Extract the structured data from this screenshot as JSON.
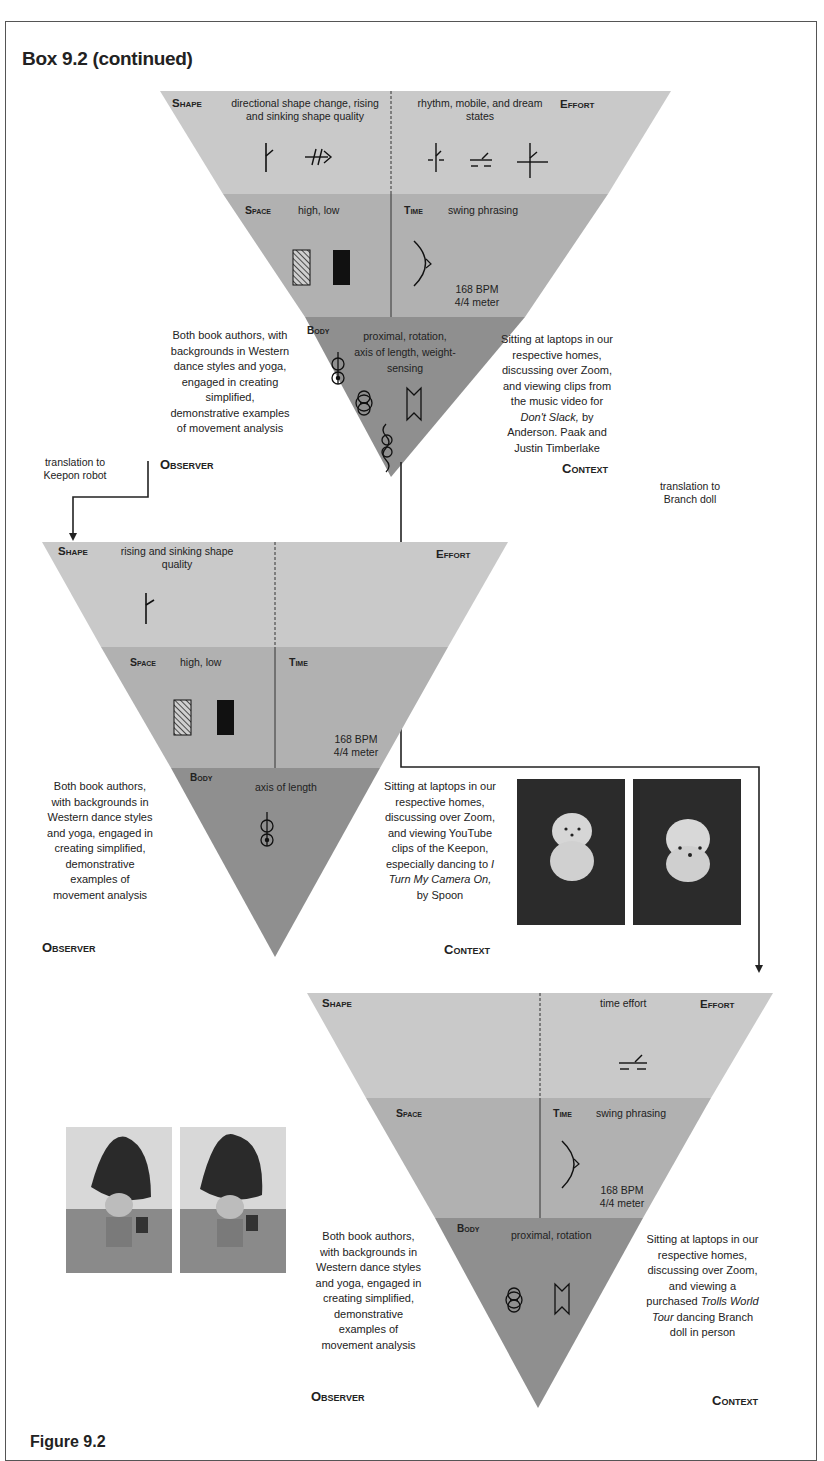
{
  "box": {
    "title": "Box 9.2 (continued)",
    "figure_label": "Figure 9.2"
  },
  "diagrams": [
    {
      "id": "original",
      "shape": {
        "label": "Shape",
        "text": "directional shape change, rising and sinking shape quality",
        "line1": "directional shape change, rising",
        "line2": "and sinking shape quality"
      },
      "effort": {
        "label": "Effort",
        "line1": "rhythm, mobile, and dream",
        "line2": "states"
      },
      "space": {
        "label": "Space",
        "text": "high, low"
      },
      "time": {
        "label": "Time",
        "text": "swing phrasing",
        "bpm": "168 BPM",
        "meter": "4/4 meter"
      },
      "body": {
        "label": "Body",
        "line1": "proximal, rotation,",
        "line2": "axis of length, weight-",
        "line3": "sensing"
      },
      "observer": {
        "label": "Observer",
        "lines": [
          "Both book authors, with",
          "backgrounds in Western",
          "dance styles and yoga,",
          "engaged in creating",
          "simplified,",
          "demonstrative examples",
          "of movement analysis"
        ]
      },
      "context": {
        "label": "Context",
        "lines": [
          "Sitting at laptops in our",
          "respective homes,",
          "discussing over Zoom,",
          "and viewing clips from",
          "the music video for"
        ],
        "italic": "Don't Slack,",
        "after_italic": " by",
        "tail": [
          "Anderson. Paak and",
          "Justin Timberlake"
        ]
      }
    },
    {
      "id": "keepon",
      "shape": {
        "label": "Shape",
        "line1": "rising and sinking shape",
        "line2": "quality"
      },
      "effort": {
        "label": "Effort"
      },
      "space": {
        "label": "Space",
        "text": "high, low"
      },
      "time": {
        "label": "Time",
        "bpm": "168 BPM",
        "meter": "4/4 meter"
      },
      "body": {
        "label": "Body",
        "line1": "axis of length"
      },
      "observer": {
        "label": "Observer",
        "lines": [
          "Both book authors,",
          "with backgrounds in",
          "Western dance styles",
          "and yoga, engaged in",
          "creating simplified,",
          "demonstrative",
          "examples of",
          "movement analysis"
        ]
      },
      "context": {
        "label": "Context",
        "lines": [
          "Sitting at laptops in our",
          "respective homes,",
          "discussing over Zoom,",
          "and viewing YouTube",
          "clips of the Keepon,",
          "especially dancing to"
        ],
        "italic_a": "I",
        "italic_b": "Turn My Camera On,",
        "tail": "by Spoon"
      }
    },
    {
      "id": "branch",
      "shape": {
        "label": "Shape"
      },
      "effort": {
        "label": "Effort",
        "text": "time effort"
      },
      "space": {
        "label": "Space"
      },
      "time": {
        "label": "Time",
        "text": "swing phrasing",
        "bpm": "168 BPM",
        "meter": "4/4 meter"
      },
      "body": {
        "label": "Body",
        "line1": "proximal, rotation"
      },
      "observer": {
        "label": "Observer",
        "lines": [
          "Both book authors,",
          "with backgrounds in",
          "Western dance styles",
          "and yoga, engaged in",
          "creating simplified,",
          "demonstrative",
          "examples of",
          "movement analysis"
        ]
      },
      "context": {
        "label": "Context",
        "lines": [
          "Sitting at laptops in our",
          "respective homes,",
          "discussing over Zoom,",
          "and viewing a"
        ],
        "pre_italic": "purchased ",
        "italic_a": "Trolls World",
        "italic_b": "Tour",
        "after_italic": " dancing Branch",
        "tail": "doll in person"
      }
    }
  ],
  "arrows": {
    "keepon": {
      "line1": "translation to",
      "line2": "Keepon robot"
    },
    "branch": {
      "line1": "translation to",
      "line2": "Branch doll"
    }
  },
  "photos": {
    "keepon": [
      "keepon-photo-front",
      "keepon-photo-side"
    ],
    "branch": [
      "branch-doll-photo-1",
      "branch-doll-photo-2"
    ]
  },
  "colors": {
    "shape_band": "#c9c9c9",
    "space_band": "#b1b1b1",
    "body_band": "#8f8f8f",
    "ink": "#222222",
    "box_border": "#555555"
  }
}
